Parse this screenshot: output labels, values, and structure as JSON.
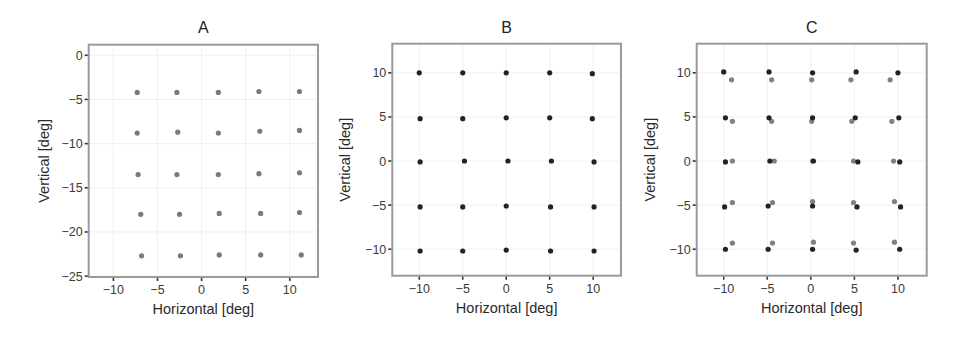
{
  "chart_data": [
    {
      "type": "scatter",
      "title": "A",
      "xlabel": "Horizontal [deg]",
      "ylabel": "Vertical [deg]",
      "xlim": [
        -12.8,
        13.2
      ],
      "ylim": [
        -25.1,
        1.2
      ],
      "xticks": [
        -10,
        -5,
        0,
        5,
        10
      ],
      "yticks": [
        0,
        -5,
        -10,
        -15,
        -20,
        -25
      ],
      "grid": true,
      "series": [
        {
          "name": "points",
          "color": "#7a7a7a",
          "points": [
            [
              -7.3,
              -4.2
            ],
            [
              -2.8,
              -4.2
            ],
            [
              1.9,
              -4.2
            ],
            [
              6.5,
              -4.1
            ],
            [
              11.1,
              -4.1
            ],
            [
              -7.3,
              -8.8
            ],
            [
              -2.7,
              -8.7
            ],
            [
              1.9,
              -8.8
            ],
            [
              6.6,
              -8.6
            ],
            [
              11.1,
              -8.5
            ],
            [
              -7.2,
              -13.5
            ],
            [
              -2.8,
              -13.5
            ],
            [
              1.9,
              -13.5
            ],
            [
              6.5,
              -13.4
            ],
            [
              11.1,
              -13.3
            ],
            [
              -6.9,
              -18.0
            ],
            [
              -2.5,
              -18.0
            ],
            [
              2.0,
              -17.9
            ],
            [
              6.7,
              -17.9
            ],
            [
              11.1,
              -17.8
            ],
            [
              -6.8,
              -22.7
            ],
            [
              -2.4,
              -22.7
            ],
            [
              2.0,
              -22.6
            ],
            [
              6.7,
              -22.6
            ],
            [
              11.3,
              -22.6
            ]
          ]
        }
      ]
    },
    {
      "type": "scatter",
      "title": "B",
      "xlabel": "Horizontal [deg]",
      "ylabel": "Vertical [deg]",
      "xlim": [
        -13.1,
        13.2
      ],
      "ylim": [
        -13.0,
        13.3
      ],
      "xticks": [
        -10,
        -5,
        0,
        5,
        10
      ],
      "yticks": [
        10,
        5,
        0,
        -5,
        -10
      ],
      "grid": true,
      "series": [
        {
          "name": "points",
          "color": "#222222",
          "points": [
            [
              -10.0,
              10.0
            ],
            [
              -5.0,
              10.0
            ],
            [
              0.0,
              10.0
            ],
            [
              5.0,
              10.0
            ],
            [
              9.9,
              9.9
            ],
            [
              -9.9,
              4.8
            ],
            [
              -5.0,
              4.8
            ],
            [
              0.0,
              4.9
            ],
            [
              5.0,
              4.9
            ],
            [
              9.9,
              4.8
            ],
            [
              -9.9,
              -0.1
            ],
            [
              -4.8,
              0.0
            ],
            [
              0.2,
              0.0
            ],
            [
              5.2,
              0.0
            ],
            [
              10.1,
              -0.1
            ],
            [
              -9.9,
              -5.2
            ],
            [
              -5.0,
              -5.2
            ],
            [
              0.0,
              -5.1
            ],
            [
              5.1,
              -5.2
            ],
            [
              10.1,
              -5.2
            ],
            [
              -9.9,
              -10.2
            ],
            [
              -5.0,
              -10.2
            ],
            [
              0.0,
              -10.1
            ],
            [
              5.1,
              -10.2
            ],
            [
              10.1,
              -10.2
            ]
          ]
        }
      ]
    },
    {
      "type": "scatter",
      "title": "C",
      "xlabel": "Horizontal [deg]",
      "ylabel": "Vertical [deg]",
      "xlim": [
        -13.1,
        13.3
      ],
      "ylim": [
        -13.0,
        13.3
      ],
      "xticks": [
        -10,
        -5,
        0,
        5,
        10
      ],
      "yticks": [
        10,
        5,
        0,
        -5,
        -10
      ],
      "grid": true,
      "series": [
        {
          "name": "grey",
          "color": "#808080",
          "points": [
            [
              -9.1,
              9.2
            ],
            [
              -4.5,
              9.2
            ],
            [
              0.1,
              9.2
            ],
            [
              4.6,
              9.2
            ],
            [
              9.1,
              9.2
            ],
            [
              -9.0,
              4.5
            ],
            [
              -4.5,
              4.5
            ],
            [
              0.1,
              4.5
            ],
            [
              4.7,
              4.5
            ],
            [
              9.3,
              4.5
            ],
            [
              -9.0,
              0.0
            ],
            [
              -4.2,
              0.0
            ],
            [
              0.2,
              0.0
            ],
            [
              4.9,
              0.0
            ],
            [
              9.5,
              0.0
            ],
            [
              -9.0,
              -4.7
            ],
            [
              -4.4,
              -4.7
            ],
            [
              0.2,
              -4.6
            ],
            [
              4.9,
              -4.7
            ],
            [
              9.6,
              -4.6
            ],
            [
              -9.0,
              -9.3
            ],
            [
              -4.4,
              -9.3
            ],
            [
              0.3,
              -9.2
            ],
            [
              4.9,
              -9.3
            ],
            [
              9.6,
              -9.2
            ]
          ]
        },
        {
          "name": "dark",
          "color": "#222222",
          "points": [
            [
              -10.0,
              10.1
            ],
            [
              -4.8,
              10.1
            ],
            [
              0.2,
              10.0
            ],
            [
              5.2,
              10.1
            ],
            [
              10.0,
              10.0
            ],
            [
              -9.8,
              4.9
            ],
            [
              -4.8,
              4.9
            ],
            [
              0.2,
              4.9
            ],
            [
              5.1,
              4.9
            ],
            [
              10.1,
              4.9
            ],
            [
              -9.8,
              -0.1
            ],
            [
              -4.7,
              0.0
            ],
            [
              0.3,
              0.0
            ],
            [
              5.4,
              -0.1
            ],
            [
              10.2,
              -0.1
            ],
            [
              -9.9,
              -5.2
            ],
            [
              -4.9,
              -5.1
            ],
            [
              0.2,
              -5.1
            ],
            [
              5.3,
              -5.2
            ],
            [
              10.3,
              -5.2
            ],
            [
              -9.8,
              -10.0
            ],
            [
              -4.9,
              -10.0
            ],
            [
              0.2,
              -10.0
            ],
            [
              5.2,
              -10.1
            ],
            [
              10.2,
              -10.0
            ]
          ]
        }
      ]
    }
  ],
  "layout": {
    "panels": [
      {
        "frame": {
          "left": 88.7,
          "top": 44.7,
          "right": 318,
          "bottom": 277
        }
      },
      {
        "frame": {
          "left": 392.3,
          "top": 43.7,
          "right": 621,
          "bottom": 275.7
        }
      },
      {
        "frame": {
          "left": 696.7,
          "top": 43.7,
          "right": 926.7,
          "bottom": 275.7
        }
      }
    ],
    "frame_color": "#9a9a9a",
    "grid_color": "#ececec",
    "point_radius": 2.6
  }
}
